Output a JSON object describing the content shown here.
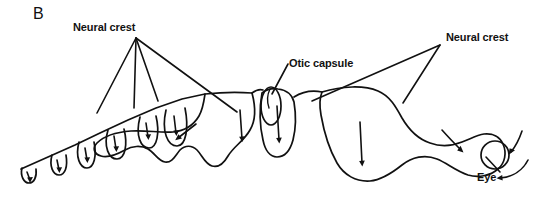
{
  "figure": {
    "panel_letter": "B",
    "background_color": "#ffffff",
    "ink_color": "#111111",
    "width": 550,
    "height": 197
  },
  "labels": {
    "neural_crest_left": "Neural crest",
    "otic_capsule": "Otic capsule",
    "neural_crest_right": "Neural crest",
    "eye": "Eye"
  },
  "structures": {
    "somite_count": 6,
    "segmented_trunk": "row of somite pockets along a diagonal neural axis",
    "mandibular_blob": "large irregular lobe in the middle of the figure",
    "otic_vesicle": "small vertical oval between the middle lobes",
    "head_blob": "large rounded lobe on the right containing the eye",
    "eye_shape": "circle"
  },
  "migration_arrows": {
    "somite_arrows": 6,
    "lobe_arrows": 5,
    "curved_head_arrows": 3,
    "direction_note": "arrows indicate direction of neural crest cell migration"
  }
}
